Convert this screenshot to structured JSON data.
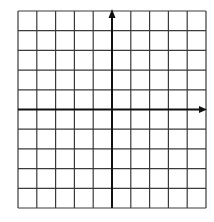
{
  "figure": {
    "type": "coordinate-grid",
    "columns": 10,
    "rows": 10,
    "y_axis_column": 5,
    "x_axis_row": 5,
    "x_axis_arrow": "right",
    "y_axis_arrow": "up",
    "colors": {
      "background": "#ffffff",
      "grid_line": "#3a3a3a",
      "axis_line": "#111111"
    },
    "geometry": {
      "left": 18,
      "top": 11,
      "right": 206,
      "bottom": 208
    }
  }
}
